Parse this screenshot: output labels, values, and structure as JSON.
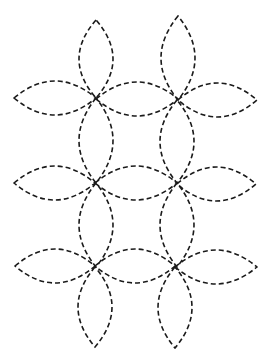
{
  "diagram": {
    "type": "quilting-stencil",
    "stroke_color": "#1a1a1a",
    "background": "#ffffff",
    "stroke_width": 1.6,
    "dash": "5 3",
    "centers": {
      "columns_x": [
        96,
        177
      ],
      "rows_y": [
        98,
        183,
        267
      ]
    },
    "petal_half_width": 17,
    "vertical_petals": [
      {
        "x": 96,
        "y1": 20,
        "y2": 98
      },
      {
        "x": 96,
        "y1": 98,
        "y2": 183
      },
      {
        "x": 96,
        "y1": 183,
        "y2": 267
      },
      {
        "x": 95,
        "y1": 267,
        "y2": 347
      },
      {
        "x": 178,
        "y1": 16,
        "y2": 100
      },
      {
        "x": 177,
        "y1": 100,
        "y2": 183
      },
      {
        "x": 177,
        "y1": 183,
        "y2": 267
      },
      {
        "x": 175,
        "y1": 267,
        "y2": 348
      }
    ],
    "horizontal_petals": [
      {
        "y": 98,
        "x1": 14,
        "x2": 96
      },
      {
        "y": 99,
        "x1": 96,
        "x2": 178
      },
      {
        "y": 100,
        "x1": 178,
        "x2": 257
      },
      {
        "y": 183,
        "x1": 14,
        "x2": 95
      },
      {
        "y": 183,
        "x1": 95,
        "x2": 177
      },
      {
        "y": 184,
        "x1": 177,
        "x2": 256
      },
      {
        "y": 266,
        "x1": 15,
        "x2": 95
      },
      {
        "y": 266,
        "x1": 95,
        "x2": 175
      },
      {
        "y": 267,
        "x1": 175,
        "x2": 257
      }
    ]
  }
}
